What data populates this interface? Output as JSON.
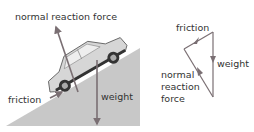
{
  "diagram": {
    "left": {
      "labels": {
        "normal": "normal reaction force",
        "friction": "friction",
        "weight": "weight"
      }
    },
    "right": {
      "labels": {
        "friction": "friction",
        "weight": "weight",
        "normal_line1": "normal",
        "normal_line2": "reaction",
        "normal_line3": "force"
      }
    },
    "colors": {
      "ramp": "#c8c8c8",
      "arrow": "#7a6f73",
      "car_body": "#d6d6d6",
      "car_outline": "#5a5a5a",
      "text": "#333333"
    }
  }
}
